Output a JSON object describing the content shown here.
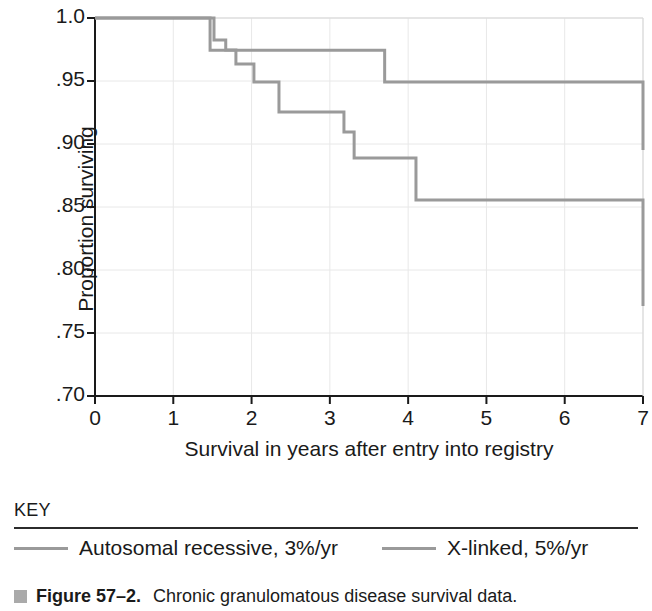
{
  "figure": {
    "marker_color": "#aaaaaa",
    "number": "Figure 57–2.",
    "caption": "Chronic granulomatous disease survival data."
  },
  "key": {
    "title": "KEY",
    "entries": [
      {
        "label": "Autosomal recessive, 3%/yr",
        "color": "#9a9a9a"
      },
      {
        "label": "X-linked, 5%/yr",
        "color": "#9a9a9a"
      }
    ]
  },
  "chart_data": {
    "type": "line",
    "title": "",
    "subtitle": "",
    "xlabel": "Survival in years after entry into registry",
    "ylabel": "Proportion surviving",
    "xlim": [
      0,
      7
    ],
    "ylim": [
      0.7,
      1.0
    ],
    "xticks": [
      0,
      1,
      2,
      3,
      4,
      5,
      6,
      7
    ],
    "xticklabels": [
      "0",
      "1",
      "2",
      "3",
      "4",
      "5",
      "6",
      "7"
    ],
    "yticks": [
      0.7,
      0.75,
      0.8,
      0.85,
      0.9,
      0.95,
      1.0
    ],
    "yticklabels": [
      ".70",
      ".75",
      ".80",
      ".85",
      ".90",
      ".95",
      "1.0"
    ],
    "grid": true,
    "grid_color": "#e8e8e8",
    "axis_color": "#1a1a1a",
    "legend_position": "below-plot-key-box",
    "step_style": "post",
    "series": [
      {
        "name": "Autosomal recessive, 3%/yr",
        "color": "#9a9a9a",
        "x": [
          0.0,
          0.59,
          1.47,
          2.15,
          3.7,
          7.0
        ],
        "y": [
          1.0,
          1.0,
          0.9745,
          0.9745,
          0.9492,
          0.8952
        ]
      },
      {
        "name": "X-linked, 5%/yr",
        "color": "#9a9a9a",
        "x": [
          0.0,
          1.0,
          1.52,
          1.67,
          1.8,
          2.03,
          2.35,
          2.83,
          3.18,
          3.31,
          3.55,
          4.1,
          7.0
        ],
        "y": [
          1.0,
          1.0,
          0.9825,
          0.9746,
          0.9635,
          0.9492,
          0.9254,
          0.9254,
          0.9095,
          0.8889,
          0.8889,
          0.8556,
          0.7714
        ]
      }
    ],
    "annotations": []
  }
}
